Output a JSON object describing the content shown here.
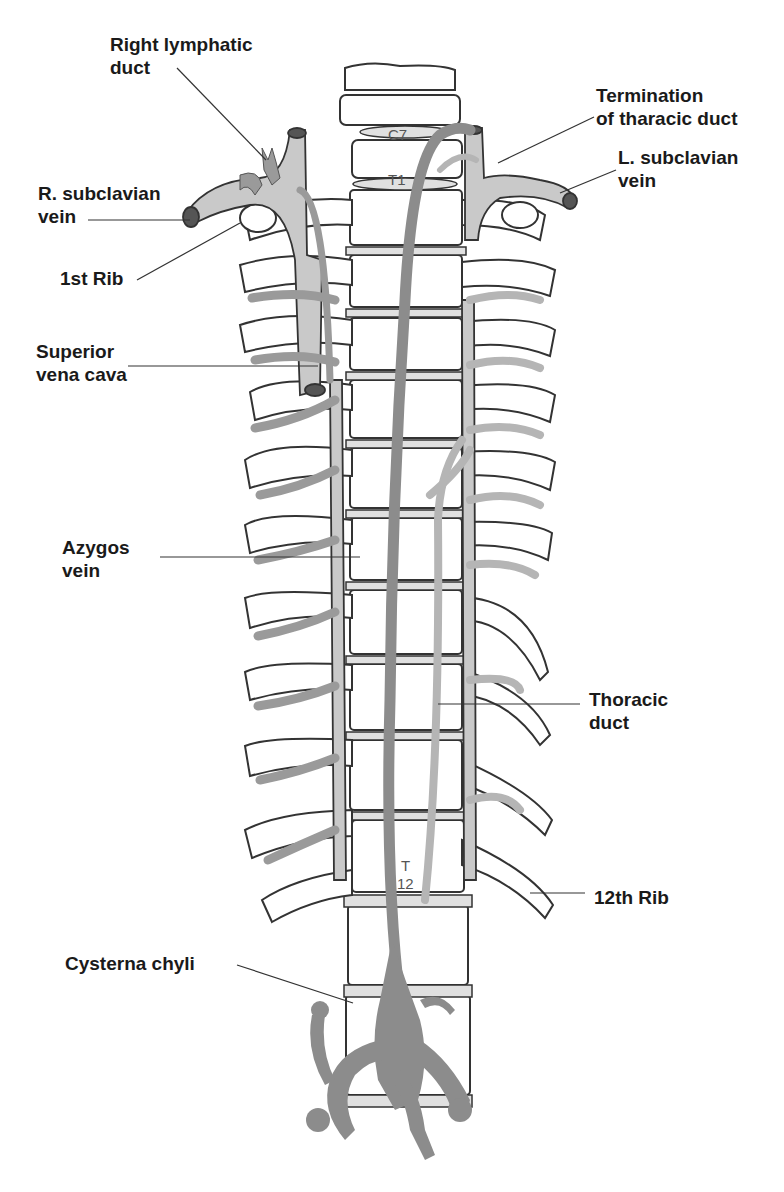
{
  "diagram": {
    "colors": {
      "background": "#ffffff",
      "outline": "#333333",
      "vein_fill": "#c9c9c9",
      "azygos_fill": "#9a9a9a",
      "thoracic_duct_fill": "#8c8c8c",
      "lymph_light": "#b5b5b5",
      "label_text": "#1a1a1a"
    },
    "labels": {
      "right_lymphatic_duct": "Right lymphatic\nduct",
      "r_subclavian_vein": "R. subclavian\nvein",
      "first_rib": "1st Rib",
      "superior_vena_cava": "Superior\nvena cava",
      "azygos_vein": "Azygos\nvein",
      "cysterna_chyli": "Cysterna chyli",
      "termination_thoracic_duct": "Termination\nof tharacic duct",
      "l_subclavian_vein": "L. subclavian\nvein",
      "thoracic_duct": "Thoracic\nduct",
      "twelfth_rib": "12th Rib"
    },
    "vertebra_labels": {
      "c7": "C7",
      "t1": "T1",
      "t12_top": "T",
      "t12_bottom": "12"
    }
  }
}
